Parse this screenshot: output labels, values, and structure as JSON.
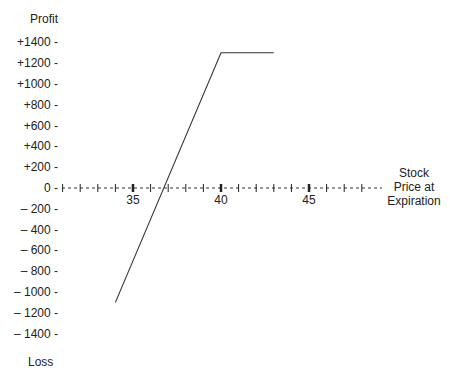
{
  "chart_data": {
    "type": "line",
    "title": "",
    "ylabel_top": "Profit",
    "ylabel_bottom": "Loss",
    "xlabel": "Stock Price at Expiration",
    "xlabel_lines": [
      "Stock",
      "Price at",
      "Expiration"
    ],
    "y_ticks": [
      "+1400 -",
      "+1200 -",
      "+1000 -",
      "+800 -",
      "+600 -",
      "+400 -",
      "+200 -",
      "0 -",
      "– 200 -",
      "– 400 -",
      "– 600 -",
      "– 800 -",
      "– 1000 -",
      "– 1200 -",
      "– 1400 -"
    ],
    "y_tick_values": [
      1400,
      1200,
      1000,
      800,
      600,
      400,
      200,
      0,
      -200,
      -400,
      -600,
      -800,
      -1000,
      -1200,
      -1400
    ],
    "x_ticks": [
      "35",
      "40",
      "45"
    ],
    "x_tick_values": [
      35,
      40,
      45
    ],
    "xlim": [
      30,
      48
    ],
    "ylim": [
      -1400,
      1400
    ],
    "grid": false,
    "series": [
      {
        "name": "Profit/Loss at Expiration",
        "x": [
          34,
          40,
          43
        ],
        "y": [
          -1100,
          1300,
          1300
        ]
      }
    ]
  }
}
